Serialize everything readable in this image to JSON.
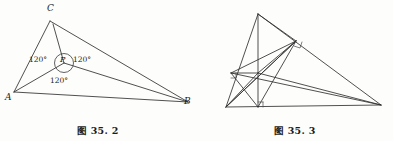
{
  "figures": [
    {
      "id": "fig-35-2",
      "caption_prefix": "图",
      "caption_number": "35. 2",
      "description": "Triangle ABC with interior Fermat point P joined to all three vertices, three 120 degree angles marked",
      "vertex_labels": [
        {
          "name": "C",
          "text": "C",
          "x": 47,
          "y": 10
        },
        {
          "name": "A",
          "text": "A",
          "x": 6,
          "y": 96
        },
        {
          "name": "B",
          "text": "B",
          "x": 184,
          "y": 100
        },
        {
          "name": "P",
          "text": "P",
          "x": 61,
          "y": 55
        }
      ],
      "angle_labels": [
        {
          "name": "angle-apb",
          "text": "120°",
          "x": 31,
          "y": 55
        },
        {
          "name": "angle-bpc",
          "text": "120°",
          "x": 73,
          "y": 55
        },
        {
          "name": "angle-apc",
          "text": "120°",
          "x": 52,
          "y": 74
        }
      ],
      "points": {
        "A": [
          14,
          92
        ],
        "B": [
          188,
          102
        ],
        "C": [
          50,
          21
        ],
        "P": [
          64,
          63
        ]
      },
      "circle": {
        "cx": 64,
        "cy": 63,
        "r": 9.5
      }
    },
    {
      "id": "fig-35-3",
      "caption_prefix": "图",
      "caption_number": "35. 3",
      "description": "Triangle with altitudes, cevians and two right angle markers",
      "vertex_labels": [],
      "angle_labels": [],
      "points": {
        "apex": [
          61,
          14
        ],
        "left": [
          29,
          107
        ],
        "right": [
          184,
          105
        ],
        "upper_right": [
          99,
          41
        ],
        "left_mid": [
          34,
          73
        ],
        "foot": [
          61,
          107
        ],
        "center": [
          61,
          73
        ]
      },
      "right_angle_markers": [
        {
          "name": "right-angle-upper",
          "x": 99,
          "y": 41
        },
        {
          "name": "right-angle-foot",
          "x": 61,
          "y": 107
        },
        {
          "name": "right-angle-left",
          "x": 34,
          "y": 73
        }
      ]
    }
  ]
}
